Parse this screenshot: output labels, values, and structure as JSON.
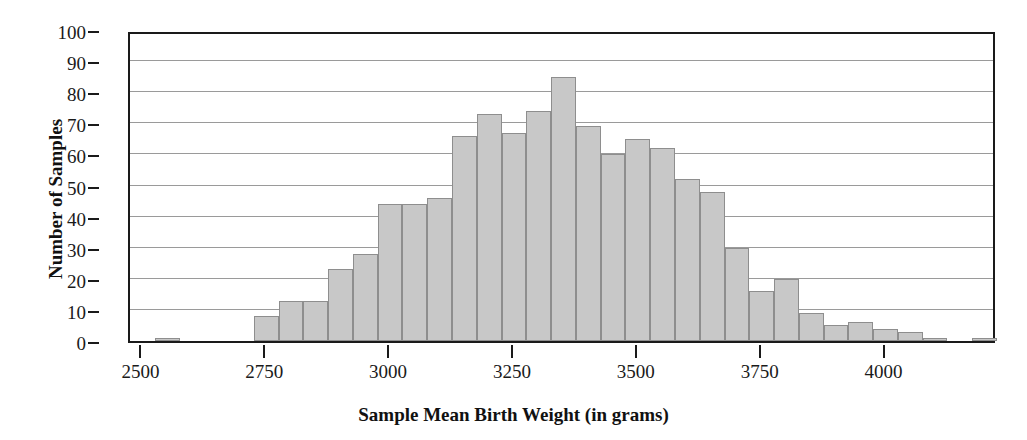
{
  "chart_data": {
    "type": "bar",
    "title": "",
    "subtitle": "",
    "xlabel": "Sample Mean Birth Weight (in grams)",
    "ylabel": "Number of Samples",
    "xlim": [
      2425,
      2425
    ],
    "ylim": [
      0,
      100
    ],
    "grid": true,
    "legend": null,
    "bin_width": 50,
    "x_tick_labels": [
      "2500",
      "2750",
      "3000",
      "3250",
      "3500",
      "3750",
      "4000"
    ],
    "x_tick_values": [
      2500,
      2750,
      3000,
      3250,
      3500,
      3750,
      4000
    ],
    "y_tick_labels": [
      "0",
      "10",
      "20",
      "30",
      "40",
      "50",
      "60",
      "70",
      "80",
      "90",
      "100"
    ],
    "y_tick_values": [
      0,
      10,
      20,
      30,
      40,
      50,
      60,
      70,
      80,
      90,
      100
    ],
    "bins": [
      {
        "start": 2475,
        "end": 2525,
        "center": 2500,
        "value": 0
      },
      {
        "start": 2525,
        "end": 2575,
        "center": 2550,
        "value": 1
      },
      {
        "start": 2575,
        "end": 2625,
        "center": 2600,
        "value": 0
      },
      {
        "start": 2625,
        "end": 2675,
        "center": 2650,
        "value": 0
      },
      {
        "start": 2675,
        "end": 2725,
        "center": 2700,
        "value": 0
      },
      {
        "start": 2725,
        "end": 2775,
        "center": 2750,
        "value": 8
      },
      {
        "start": 2775,
        "end": 2825,
        "center": 2800,
        "value": 13
      },
      {
        "start": 2825,
        "end": 2875,
        "center": 2850,
        "value": 13
      },
      {
        "start": 2875,
        "end": 2925,
        "center": 2900,
        "value": 23
      },
      {
        "start": 2925,
        "end": 2975,
        "center": 2950,
        "value": 28
      },
      {
        "start": 2975,
        "end": 3025,
        "center": 3000,
        "value": 44
      },
      {
        "start": 3025,
        "end": 3075,
        "center": 3050,
        "value": 44
      },
      {
        "start": 3075,
        "end": 3125,
        "center": 3100,
        "value": 46
      },
      {
        "start": 3125,
        "end": 3175,
        "center": 3150,
        "value": 66
      },
      {
        "start": 3175,
        "end": 3225,
        "center": 3200,
        "value": 73
      },
      {
        "start": 3225,
        "end": 3275,
        "center": 3250,
        "value": 67
      },
      {
        "start": 3275,
        "end": 3325,
        "center": 3300,
        "value": 74
      },
      {
        "start": 3325,
        "end": 3375,
        "center": 3350,
        "value": 85
      },
      {
        "start": 3375,
        "end": 3425,
        "center": 3400,
        "value": 69
      },
      {
        "start": 3425,
        "end": 3475,
        "center": 3450,
        "value": 60
      },
      {
        "start": 3475,
        "end": 3525,
        "center": 3500,
        "value": 65
      },
      {
        "start": 3525,
        "end": 3575,
        "center": 3550,
        "value": 62
      },
      {
        "start": 3575,
        "end": 3625,
        "center": 3600,
        "value": 52
      },
      {
        "start": 3625,
        "end": 3675,
        "center": 3650,
        "value": 48
      },
      {
        "start": 3675,
        "end": 3725,
        "center": 3700,
        "value": 30
      },
      {
        "start": 3725,
        "end": 3775,
        "center": 3750,
        "value": 16
      },
      {
        "start": 3775,
        "end": 3825,
        "center": 3800,
        "value": 20
      },
      {
        "start": 3825,
        "end": 3875,
        "center": 3850,
        "value": 9
      },
      {
        "start": 3875,
        "end": 3925,
        "center": 3900,
        "value": 5
      },
      {
        "start": 3925,
        "end": 3975,
        "center": 3950,
        "value": 6
      },
      {
        "start": 3975,
        "end": 4025,
        "center": 4000,
        "value": 4
      },
      {
        "start": 4025,
        "end": 4075,
        "center": 4050,
        "value": 3
      },
      {
        "start": 4075,
        "end": 4125,
        "center": 4100,
        "value": 1
      },
      {
        "start": 4125,
        "end": 4175,
        "center": 4150,
        "value": 0
      },
      {
        "start": 4175,
        "end": 4225,
        "center": 4200,
        "value": 1
      }
    ],
    "colors": {
      "bar_fill": "#c8c8c8",
      "bar_edge": "#8e8e8e",
      "gridline": "#9a9a9a",
      "axis": "#1a1a1a",
      "text": "#111111",
      "background": "#ffffff"
    }
  }
}
